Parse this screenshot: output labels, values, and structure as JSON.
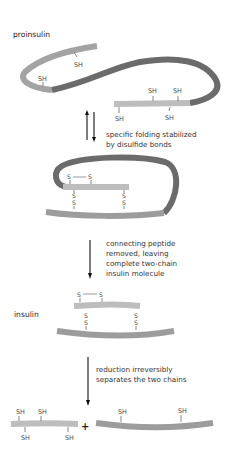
{
  "labels": {
    "proinsulin": "proinsulin",
    "insulin": "insulin",
    "plus": "+"
  },
  "steps": [
    {
      "line1": "specific folding stabilized",
      "line2": "by disulfide bonds",
      "arrow": "reversible"
    },
    {
      "line1": "connecting peptide",
      "line2": "removed, leaving",
      "line3": "complete two-chain",
      "line4": "insulin molecule",
      "arrow": "forward"
    },
    {
      "line1": "reduction irreversibly",
      "line2": "separates the two chains",
      "arrow": "forward"
    }
  ],
  "groups": {
    "sh": "SH",
    "s": "S",
    "dash": "—"
  },
  "colors": {
    "a_chain": "#b3b3b3",
    "b_chain": "#9c9c9c",
    "c_peptide": "#6a6a6a",
    "text": "#333333"
  }
}
